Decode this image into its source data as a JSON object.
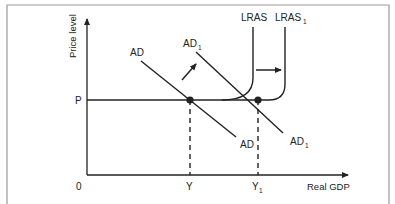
{
  "diagram": {
    "axes": {
      "y_label": "Price level",
      "x_label": "Real GDP",
      "origin_label": "0"
    },
    "price_level": {
      "label": "P"
    },
    "output_levels": [
      {
        "label": "Y",
        "sub": ""
      },
      {
        "label": "Y",
        "sub": "1"
      }
    ],
    "curves": {
      "ad": {
        "label": "AD",
        "sub": ""
      },
      "ad1": {
        "label": "AD",
        "sub": "1"
      },
      "lras": {
        "label": "LRAS",
        "sub": ""
      },
      "lras1": {
        "label": "LRAS",
        "sub": "1"
      }
    },
    "shifts": [
      {
        "from": "AD",
        "to": "AD1",
        "direction": "up-right"
      },
      {
        "from": "LRAS",
        "to": "LRAS1",
        "direction": "right"
      }
    ],
    "equilibria": [
      {
        "curve": "AD",
        "at": "P, Y"
      },
      {
        "curve": "AD1",
        "at": "P, Y1"
      }
    ],
    "colors": {
      "ink": "#222222",
      "frame": "#999999"
    }
  }
}
